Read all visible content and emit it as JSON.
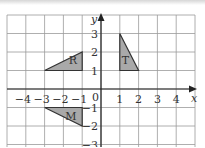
{
  "diagram": {
    "type": "coordinate-grid",
    "origin_label": "0",
    "axes": {
      "x_label": "x",
      "y_label": "y",
      "x_range": [
        -5,
        5
      ],
      "y_range": [
        -3,
        4
      ],
      "x_ticks": [
        {
          "value": -4,
          "label": "−4"
        },
        {
          "value": -3,
          "label": "−3"
        },
        {
          "value": -2,
          "label": "−2"
        },
        {
          "value": -1,
          "label": "−1"
        },
        {
          "value": 1,
          "label": "1"
        },
        {
          "value": 2,
          "label": "2"
        },
        {
          "value": 3,
          "label": "3"
        },
        {
          "value": 4,
          "label": "4"
        }
      ],
      "y_ticks": [
        {
          "value": 3,
          "label": "3"
        },
        {
          "value": 2,
          "label": "2"
        },
        {
          "value": 1,
          "label": "1"
        },
        {
          "value": -1,
          "label": "−1"
        },
        {
          "value": -2,
          "label": "−2"
        },
        {
          "value": -3,
          "label": "−3"
        }
      ]
    },
    "shapes": [
      {
        "name": "R",
        "label": "R",
        "vertices": [
          [
            -3,
            1
          ],
          [
            -1,
            1
          ],
          [
            -1,
            2
          ]
        ],
        "label_pos": [
          -1.5,
          1.35
        ]
      },
      {
        "name": "T",
        "label": "T",
        "vertices": [
          [
            1,
            1
          ],
          [
            1,
            3
          ],
          [
            2,
            1
          ]
        ],
        "label_pos": [
          1.3,
          1.35
        ]
      },
      {
        "name": "M",
        "label": "M",
        "vertices": [
          [
            -3,
            -1
          ],
          [
            -1,
            -1
          ],
          [
            -1,
            -2
          ]
        ],
        "label_pos": [
          -1.6,
          -1.65
        ]
      }
    ],
    "colors": {
      "fill": "#a9a9a9",
      "stroke": "#333333",
      "grid": "#9a9a9a",
      "axis": "#222222"
    }
  }
}
